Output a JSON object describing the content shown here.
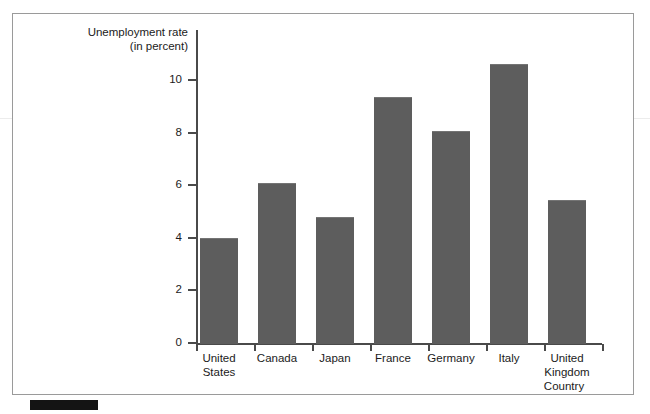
{
  "chart_data": {
    "type": "bar",
    "title": "",
    "subtitle": "",
    "ylabel_line1": "Unemployment rate",
    "ylabel_line2": "(in percent)",
    "xlabel": "Country",
    "categories": [
      "United States",
      "Canada",
      "Japan",
      "France",
      "Germany",
      "Italy",
      "United Kingdom"
    ],
    "category_lines": [
      [
        "United",
        "States"
      ],
      [
        "Canada"
      ],
      [
        "Japan"
      ],
      [
        "France"
      ],
      [
        "Germany"
      ],
      [
        "Italy"
      ],
      [
        "United",
        "Kingdom"
      ]
    ],
    "values": [
      4.0,
      6.1,
      4.8,
      9.35,
      8.05,
      10.6,
      5.45
    ],
    "ylim": [
      0,
      11.9
    ],
    "yticks": [
      0,
      2,
      4,
      6,
      8,
      10
    ],
    "ytick_labels": [
      "0",
      "2",
      "4",
      "6",
      "8",
      "10"
    ],
    "grid": false,
    "legend": "none",
    "bar_color": "#5d5d5d",
    "axis_color": "#4a4a4a",
    "text_color": "#1b1b1b",
    "frame_color": "#9a9a9a",
    "marker_color": "#141414"
  }
}
